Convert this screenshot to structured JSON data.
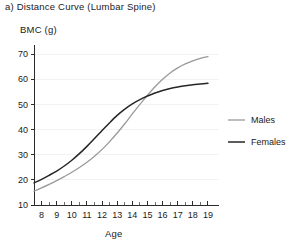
{
  "figure": {
    "panel_label": "a)",
    "title": "a) Distance Curve (Lumbar Spine)"
  },
  "axes": {
    "y_title": "BMC (g)",
    "x_title": "Age",
    "y_tick_labels": [
      "10",
      "20",
      "30",
      "40",
      "50",
      "60",
      "70"
    ],
    "x_tick_labels": [
      "8",
      "9",
      "10",
      "11",
      "12",
      "13",
      "14",
      "15",
      "16",
      "17",
      "18",
      "19"
    ]
  },
  "legend": {
    "entries": [
      {
        "label": "Males",
        "color": "#9a9a9a"
      },
      {
        "label": "Females",
        "color": "#262626"
      }
    ]
  },
  "chart_data": {
    "type": "line",
    "title": "a) Distance Curve (Lumbar Spine)",
    "xlabel": "Age",
    "ylabel": "BMC (g)",
    "xlim": [
      7.5,
      19.2
    ],
    "ylim": [
      10,
      72
    ],
    "y_ticks": [
      10,
      20,
      30,
      40,
      50,
      60,
      70
    ],
    "x_ticks": [
      8,
      9,
      10,
      11,
      12,
      13,
      14,
      15,
      16,
      17,
      18,
      19
    ],
    "x_minor_tick_interval": 0.5,
    "grid": "horizontal-faint",
    "legend_position": "right",
    "x": [
      7.5,
      8,
      8.5,
      9,
      9.5,
      10,
      10.5,
      11,
      11.5,
      12,
      12.5,
      13,
      13.5,
      14,
      14.5,
      15,
      15.5,
      16,
      16.5,
      17,
      17.5,
      18,
      18.5,
      19
    ],
    "series": [
      {
        "name": "Males",
        "color": "#9a9a9a",
        "stroke_width": 1.3,
        "values": [
          15.5,
          16.8,
          18.2,
          19.7,
          21.3,
          23.0,
          24.9,
          27.0,
          29.4,
          32.1,
          35.2,
          38.6,
          42.3,
          46.2,
          50.0,
          53.6,
          57.0,
          60.0,
          62.5,
          64.5,
          66.1,
          67.3,
          68.3,
          69.0
        ]
      },
      {
        "name": "Females",
        "color": "#262626",
        "stroke_width": 1.5,
        "values": [
          18.8,
          20.2,
          21.8,
          23.5,
          25.5,
          27.8,
          30.4,
          33.3,
          36.4,
          39.6,
          42.7,
          45.6,
          48.1,
          50.2,
          51.9,
          53.3,
          54.5,
          55.5,
          56.3,
          56.9,
          57.4,
          57.8,
          58.1,
          58.4
        ]
      }
    ],
    "crossing_point": {
      "age": 15.0,
      "bmc": 51.5
    }
  }
}
